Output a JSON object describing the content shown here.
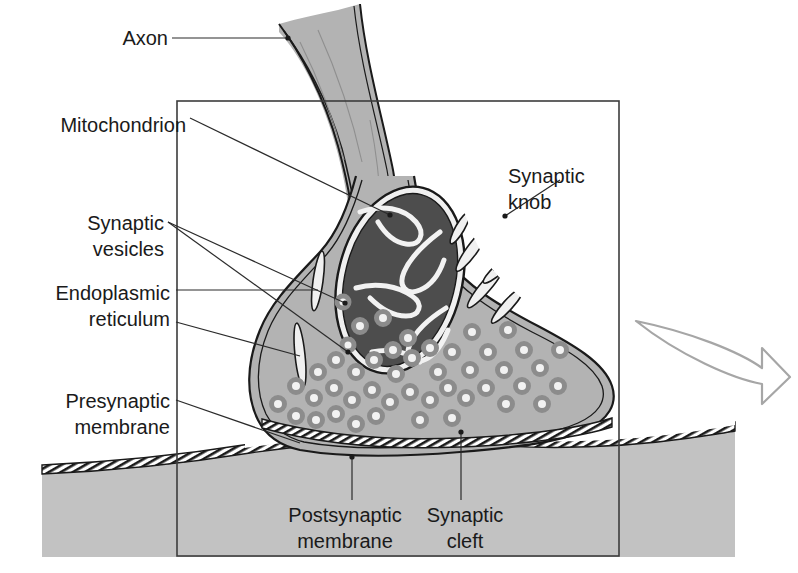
{
  "figure": {
    "type": "labeled-biological-diagram"
  },
  "labels": {
    "axon": "Axon",
    "mitochondrion": "Mitochondrion",
    "synaptic_vesicles_line1": "Synaptic",
    "synaptic_vesicles_line2": "vesicles",
    "endoplasmic_reticulum_line1": "Endoplasmic",
    "endoplasmic_reticulum_line2": "reticulum",
    "presynaptic_membrane_line1": "Presynaptic",
    "presynaptic_membrane_line2": "membrane",
    "synaptic_knob_line1": "Synaptic",
    "synaptic_knob_line2": "knob",
    "postsynaptic_membrane_line1": "Postsynaptic",
    "postsynaptic_membrane_line2": "membrane",
    "synaptic_cleft_line1": "Synaptic",
    "synaptic_cleft_line2": "cleft"
  },
  "colors": {
    "cytoplasm": "#b3b3b3",
    "mitochondrion_matrix": "#4d4d4d",
    "postsynaptic_cell": "#c2c2c2",
    "vesicle_ring": "#8c8c8c",
    "vesicle_lumen": "#f2f2f2",
    "outline": "#1a1a1a",
    "frame": "#3c3c3c",
    "arrow": "#a6a6a6",
    "background": "#ffffff",
    "text": "#1a1a1a"
  },
  "structures": {
    "axon": "axon stalk entering from top",
    "synaptic_knob": "presynaptic terminal bulb",
    "mitochondrion": "dark organelle with cristae",
    "vesicles_count": 46,
    "endoplasmic_reticulum_count": 7,
    "synaptic_cleft": "gap between presynaptic and postsynaptic membranes",
    "direction_arrow": "curved arrow indicating signal direction, rightward"
  }
}
